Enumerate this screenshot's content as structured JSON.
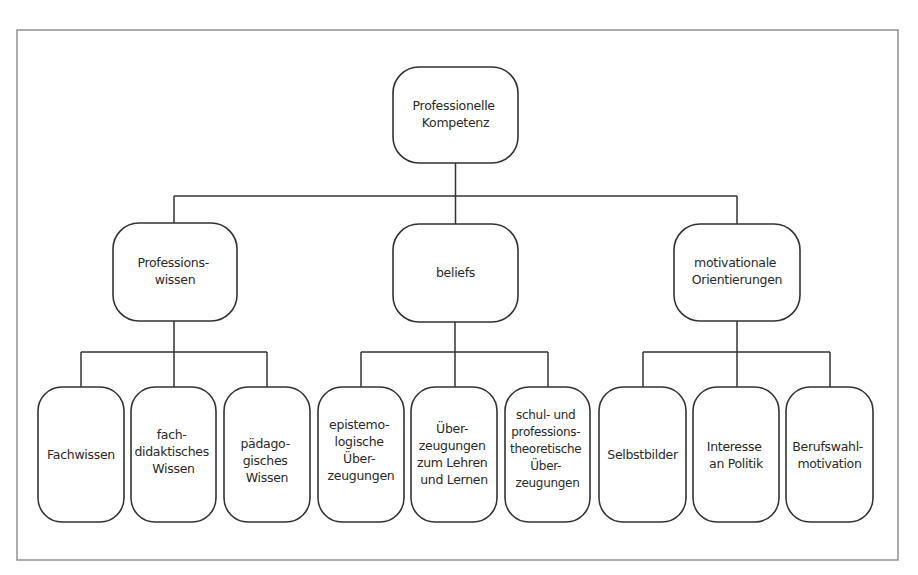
{
  "diagram": {
    "type": "hierarchy-tree",
    "colors": {
      "background": "#ffffff",
      "frame": "#8a8a8a",
      "lines": "#333333",
      "text": "#2a2a2a"
    },
    "root": {
      "id": "professionelle-kompetenz",
      "lines": [
        "Professionelle",
        "Kompetenz"
      ],
      "children": [
        {
          "id": "professionswissen",
          "lines": [
            "Professions-",
            "wissen"
          ],
          "children": [
            {
              "id": "fachwissen",
              "lines": [
                "Fachwissen"
              ]
            },
            {
              "id": "fachdidaktisches-wissen",
              "lines": [
                "fach-",
                "didaktisches",
                "Wissen"
              ]
            },
            {
              "id": "paedagogisches-wissen",
              "lines": [
                "pädago-",
                "gisches",
                "Wissen"
              ]
            }
          ]
        },
        {
          "id": "beliefs",
          "lines": [
            "beliefs"
          ],
          "children": [
            {
              "id": "epistemologische-ueberzeugungen",
              "lines": [
                "epistemo-",
                "logische",
                "Über-",
                "zeugungen"
              ]
            },
            {
              "id": "ueberzeugungen-lehren-lernen",
              "lines": [
                "Über-",
                "zeugungen",
                "zum Lehren",
                "und Lernen"
              ]
            },
            {
              "id": "schul-professionstheoretische-ueberzeugungen",
              "lines": [
                "schul- und",
                "professions-",
                "theoretische",
                "Über-",
                "zeugungen"
              ]
            }
          ]
        },
        {
          "id": "motivationale-orientierungen",
          "lines": [
            "motivationale",
            "Orientierungen"
          ],
          "children": [
            {
              "id": "selbstbilder",
              "lines": [
                "Selbstbilder"
              ]
            },
            {
              "id": "interesse-an-politik",
              "lines": [
                "Interesse",
                "an Politik"
              ]
            },
            {
              "id": "berufswahlmotivation",
              "lines": [
                "Berufswahl-",
                "motivation"
              ]
            }
          ]
        }
      ]
    }
  }
}
